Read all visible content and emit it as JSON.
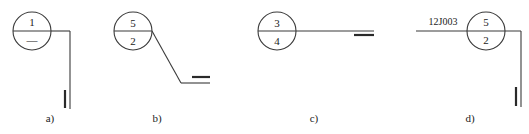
{
  "figure": {
    "panels": [
      {
        "label": "a)",
        "upper": "1",
        "lower": "—",
        "leader": "vertical-down",
        "reference": ""
      },
      {
        "label": "b)",
        "upper": "5",
        "lower": "2",
        "leader": "diagonal-down-right",
        "reference": ""
      },
      {
        "label": "c)",
        "upper": "3",
        "lower": "4",
        "leader": "horizontal-right",
        "reference": ""
      },
      {
        "label": "d)",
        "upper": "5",
        "lower": "2",
        "leader": "vertical-down",
        "reference": "12J003"
      }
    ]
  }
}
